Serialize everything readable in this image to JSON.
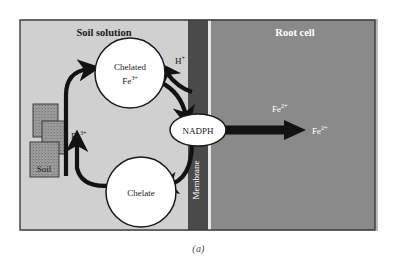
{
  "figure": {
    "caption": "(a)",
    "title_soil": "Soil solution",
    "title_root": "Root cell"
  },
  "colors": {
    "soil_solution_bg": "#d0d0d0",
    "root_cell_bg": "#8a8a8a",
    "membrane": "#4a4a4a",
    "membrane_line": "#e8e8e8",
    "arrow": "#121212",
    "node_fill": "#ffffff",
    "node_stroke": "#1a1a1a",
    "panel_border": "#3a3a3a",
    "shadow": "#b9b9b9",
    "soil_block_fill": "#9a9a9a",
    "soil_block_stroke": "#3a3a3a",
    "text_dark": "#1a1a1a",
    "text_light": "#ffffff",
    "caption_text": "#4a4a4a",
    "page_bg": "#ffffff"
  },
  "regions": [
    {
      "id": "soil-solution",
      "label": "Soil solution",
      "text_color": "dark"
    },
    {
      "id": "membrane",
      "label": "Membrane",
      "text_color": "light"
    },
    {
      "id": "root-cell",
      "label": "Root cell",
      "text_color": "light"
    }
  ],
  "nodes": [
    {
      "id": "chelated-fe3",
      "shape": "circle",
      "line1": "Chelated",
      "line2_base": "Fe",
      "line2_sup": "3+"
    },
    {
      "id": "chelate",
      "shape": "circle",
      "line1": "Chelate"
    },
    {
      "id": "nadph",
      "shape": "ellipse",
      "line1": "NADPH"
    },
    {
      "id": "soil-aggregate",
      "shape": "blocks",
      "line1": "Soil"
    }
  ],
  "labels": [
    {
      "id": "fe3-soil",
      "base": "Fe",
      "sup": "3+",
      "color": "dark"
    },
    {
      "id": "h-plus",
      "base": "H",
      "sup": "+",
      "color": "dark"
    },
    {
      "id": "fe2-membrane",
      "base": "Fe",
      "sup": "2+",
      "color": "light"
    },
    {
      "id": "fe2-cytosol",
      "base": "Fe",
      "sup": "2+",
      "color": "light"
    }
  ],
  "flows": [
    {
      "id": "soil-to-chelated",
      "from": "soil-aggregate",
      "to": "chelated-fe3",
      "label": "Fe3+"
    },
    {
      "id": "chelate-to-soil",
      "from": "chelate",
      "to": "soil-region",
      "label": "Fe3+"
    },
    {
      "id": "membrane-to-chelated",
      "from": "membrane",
      "to": "chelated-fe3",
      "label": "H+"
    },
    {
      "id": "chelated-to-nadph",
      "from": "chelated-fe3",
      "to": "nadph",
      "label": ""
    },
    {
      "id": "nadph-to-chelate",
      "from": "nadph",
      "to": "chelate",
      "label": ""
    },
    {
      "id": "nadph-to-cytosol",
      "from": "nadph",
      "to": "root-cell",
      "label": "Fe2+"
    }
  ]
}
